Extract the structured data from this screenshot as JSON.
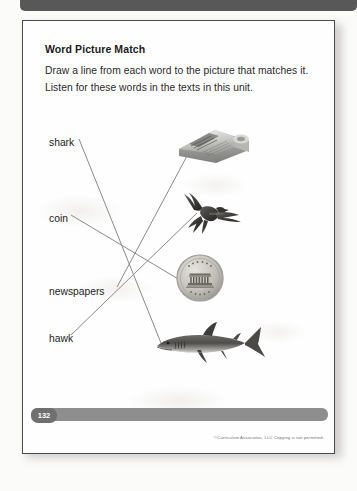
{
  "worksheet": {
    "title": "Word Picture Match",
    "instructions": [
      "Draw a line from each word to the picture that matches it.",
      "Listen for these words in the texts in this unit."
    ],
    "words": [
      {
        "label": "shark",
        "x": 48,
        "y": 136
      },
      {
        "label": "coin",
        "x": 48,
        "y": 212
      },
      {
        "label": "newspapers",
        "x": 48,
        "y": 285
      },
      {
        "label": "hawk",
        "x": 48,
        "y": 332
      }
    ],
    "pictures": [
      {
        "name": "newspapers-photo",
        "alt": "stack of folded newspapers",
        "x": 168,
        "y": 118
      },
      {
        "name": "hawk-photo",
        "alt": "hawk flying with wings spread",
        "x": 172,
        "y": 190
      },
      {
        "name": "coin-photo",
        "alt": "penny coin showing Lincoln Memorial",
        "x": 174,
        "y": 252
      },
      {
        "name": "shark-photo",
        "alt": "gray shark swimming",
        "x": 150,
        "y": 318
      }
    ],
    "connectors": [
      {
        "name": "shark-connector",
        "from": "shark",
        "to": "shark-photo",
        "x1": 78,
        "y1": 138,
        "x2": 160,
        "y2": 342
      },
      {
        "name": "coin-connector",
        "from": "coin",
        "to": "coin-photo",
        "x1": 70,
        "y1": 214,
        "x2": 194,
        "y2": 288
      },
      {
        "name": "newspapers-connector",
        "from": "newspapers",
        "to": "newspapers-photo",
        "x1": 116,
        "y1": 286,
        "x2": 194,
        "y2": 140
      },
      {
        "name": "hawk-connector",
        "from": "hawk",
        "to": "hawk-photo",
        "x1": 70,
        "y1": 334,
        "x2": 196,
        "y2": 212
      }
    ],
    "footer": {
      "page_number": "132",
      "copyright": "©Curriculum Associates, LLC    Copying is not permitted."
    },
    "colors": {
      "ink": "#232323",
      "line": "#8a8a8a",
      "footer_bar": "#8e8e8e",
      "badge": "#6f6f6f",
      "page_border": "#4b4b4b"
    }
  }
}
